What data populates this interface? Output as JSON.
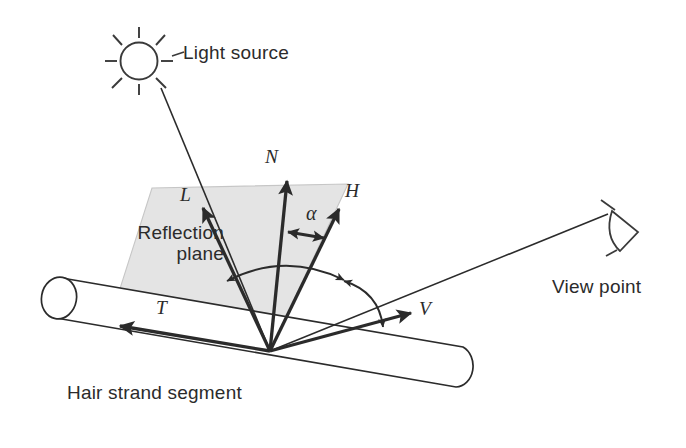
{
  "figure": {
    "title_text_labels": {
      "light_source": "Light source",
      "reflection_plane_line1": "Reflection",
      "reflection_plane_line2": "plane",
      "hair_strand_segment": "Hair strand segment",
      "view_point": "View point"
    },
    "vector_labels": {
      "N": "N",
      "L": "L",
      "H": "H",
      "T": "T",
      "V": "V"
    },
    "angle_labels": {
      "alpha": "α"
    },
    "icons": {
      "sun": "sun-icon",
      "eye": "eye-icon",
      "cylinder": "cylinder-icon"
    },
    "colors": {
      "stroke": "#2b2b2b",
      "plane_fill": "#e3e3e3",
      "plane_stroke": "#bdbdbd",
      "background": "#ffffff"
    },
    "geometry": {
      "origin": [
        270,
        351
      ],
      "vectors": {
        "N": {
          "tip": [
            287,
            179
          ]
        },
        "L": {
          "tip": [
            202,
            206
          ]
        },
        "H": {
          "tip": [
            339,
            207
          ]
        },
        "T": {
          "tip": [
            118,
            327
          ]
        },
        "V": {
          "tip": [
            412,
            312
          ]
        }
      },
      "plane_quad": [
        [
          152,
          188
        ],
        [
          348,
          184
        ],
        [
          270,
          351
        ],
        [
          110,
          320
        ]
      ],
      "light_ray": [
        [
          161,
          90
        ],
        [
          270,
          351
        ]
      ],
      "view_ray": [
        [
          270,
          351
        ],
        [
          612,
          212
        ]
      ],
      "sun_center": [
        139,
        61
      ],
      "sun_radius": 18,
      "eye_apex": [
        612,
        212
      ]
    }
  }
}
